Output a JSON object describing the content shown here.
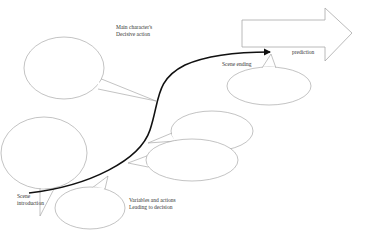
{
  "diagram": {
    "type": "story plot arc",
    "labels": {
      "scene_intro_1": "Scene",
      "scene_intro_2": "introduction",
      "decisive_1": "Main character's",
      "decisive_2": "Decisive action",
      "scene_ending": "Scene ending",
      "prediction": "prediction",
      "variables_1": "Variables and actions",
      "variables_2": "Leading to decision"
    },
    "colors": {
      "arc": "#111111",
      "bubble_stroke": "#9a9a9a",
      "arrow_stroke": "#a8a8a8"
    },
    "bubbles": [
      {
        "name": "decisive-action-bubble",
        "cx": 64,
        "cy": 68,
        "rx": 40,
        "ry": 31
      },
      {
        "name": "scene-intro-bubble",
        "cx": 44,
        "cy": 153,
        "rx": 43,
        "ry": 36
      },
      {
        "name": "variables-bubble",
        "cx": 90,
        "cy": 208,
        "rx": 35,
        "ry": 21
      },
      {
        "name": "upper-right-bubble",
        "cx": 212,
        "cy": 131,
        "rx": 41,
        "ry": 20
      },
      {
        "name": "lower-right-bubble",
        "cx": 192,
        "cy": 160,
        "rx": 46,
        "ry": 21
      },
      {
        "name": "scene-ending-bubble",
        "cx": 269,
        "cy": 86,
        "rx": 42,
        "ry": 19
      }
    ]
  }
}
